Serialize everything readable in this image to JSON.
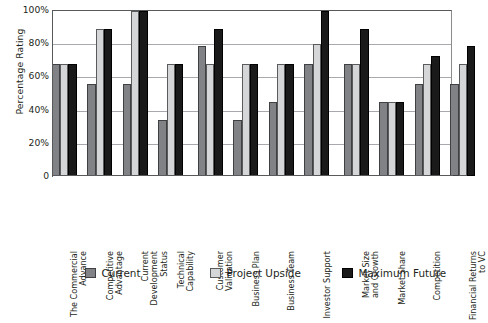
{
  "chart_data": {
    "type": "bar",
    "title": "",
    "xlabel": "",
    "ylabel": "Percentage Rating",
    "ylim": [
      0,
      100
    ],
    "y_ticks": [
      0,
      20,
      40,
      60,
      80,
      100
    ],
    "y_tick_labels": [
      "0",
      "20%",
      "40%",
      "60%",
      "80%",
      "100%"
    ],
    "grid": true,
    "legend_position": "bottom",
    "categories": [
      "The Commercial\nAdvance",
      "Competitive\nAdvantage",
      "Current\nDevelopment Status",
      "Technical Capability",
      "Customer Validation",
      "Business Plan",
      "Business Team",
      "Investor Support",
      "Market Size\nand Growth",
      "Market Share",
      "Competition",
      "Financial Returns\nto VC"
    ],
    "sections": [
      {
        "name": "commercial",
        "categories": [
          0,
          1,
          2,
          3
        ]
      },
      {
        "name": "venture",
        "categories": [
          4,
          5,
          6,
          7
        ]
      },
      {
        "name": "market",
        "categories": [
          8,
          9,
          10,
          11
        ]
      }
    ],
    "series": [
      {
        "name": "Current",
        "color": "#808285",
        "values": [
          68,
          56,
          56,
          34,
          79,
          34,
          45,
          68,
          68,
          45,
          56,
          56
        ]
      },
      {
        "name": "Project Upside",
        "color": "#d5d6d8",
        "values": [
          68,
          89,
          100,
          68,
          68,
          68,
          68,
          80,
          68,
          45,
          68,
          68
        ]
      },
      {
        "name": "Maximum Future",
        "color": "#1a1a1a",
        "values": [
          68,
          89,
          100,
          68,
          89,
          68,
          68,
          100,
          89,
          45,
          73,
          79
        ]
      }
    ]
  },
  "legend": {
    "items": [
      {
        "label": "Current",
        "swatch": "current-swatch"
      },
      {
        "label": "Project Upside",
        "swatch": "project-upside-swatch"
      },
      {
        "label": "Maximum Future",
        "swatch": "maximum-future-swatch"
      }
    ]
  }
}
